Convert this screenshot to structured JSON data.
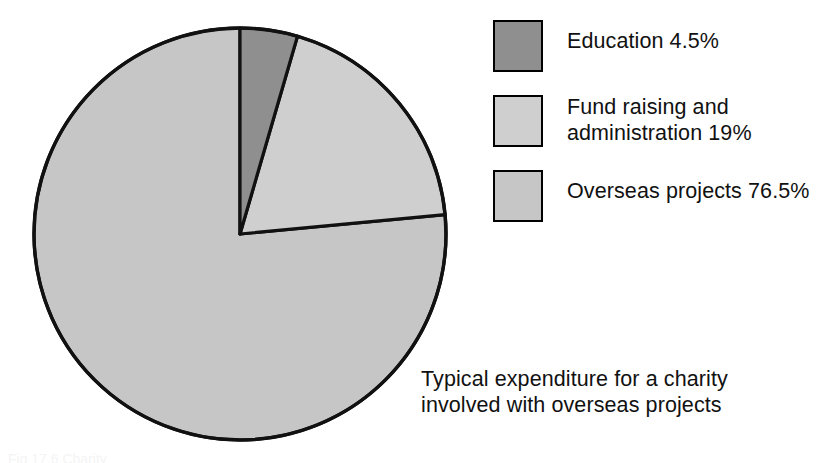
{
  "chart_data": {
    "type": "pie",
    "title": "",
    "caption": "Typical expenditure for a charity\ninvolved with overseas projects",
    "categories": [
      "Education",
      "Fund raising and administration",
      "Overseas projects"
    ],
    "values": [
      4.5,
      19,
      76.5
    ],
    "value_unit": "%",
    "value_labels": [
      "4.5%",
      "19%",
      "76.5%"
    ],
    "colors": [
      "#8f8f8f",
      "#cfcfcf",
      "#c6c6c6"
    ],
    "start_angle_deg": 0,
    "direction": "clockwise",
    "legend_position": "right",
    "grid": false,
    "outline_color": "#111111"
  },
  "legend": {
    "title": "",
    "items": [
      {
        "name": "Education",
        "value_label": "4.5%",
        "text": "Education  4.5%",
        "color": "#8f8f8f",
        "swatch_name": "legend-swatch-education"
      },
      {
        "name": "Fund raising and administration",
        "value_label": "19%",
        "text": "Fund raising and\nadministration  19%",
        "color": "#cfcfcf",
        "swatch_name": "legend-swatch-fund-raising"
      },
      {
        "name": "Overseas projects",
        "value_label": "76.5%",
        "text": "Overseas projects  76.5%",
        "color": "#c6c6c6",
        "swatch_name": "legend-swatch-overseas-projects"
      }
    ]
  },
  "caption": {
    "text": "Typical expenditure for a charity\ninvolved with overseas projects"
  },
  "figure_label": {
    "text": "Fig 17.6  Charity"
  }
}
